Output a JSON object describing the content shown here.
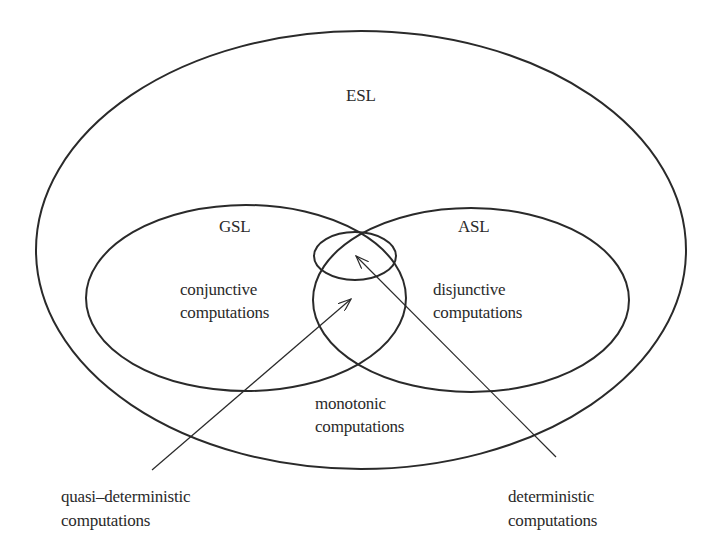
{
  "diagram": {
    "type": "nested-venn",
    "stroke_color": "#2a2a2a",
    "sets": {
      "esl": {
        "label": "ESL"
      },
      "gsl": {
        "label": "GSL",
        "description_line1": "conjunctive",
        "description_line2": "computations"
      },
      "asl": {
        "label": "ASL",
        "description_line1": "disjunctive",
        "description_line2": "computations"
      },
      "intersection": {
        "description": "quasi-deterministic computations"
      },
      "inner": {
        "description": "deterministic computations"
      }
    },
    "region_labels": {
      "monotonic_line1": "monotonic",
      "monotonic_line2": "computations"
    },
    "callouts": {
      "quasi_line1": "quasi–deterministic",
      "quasi_line2": "computations",
      "det_line1": "deterministic",
      "det_line2": "computations"
    }
  }
}
